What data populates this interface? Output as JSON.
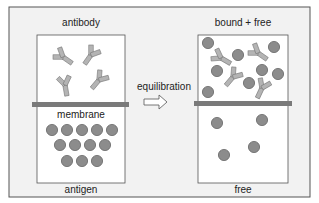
{
  "diagram": {
    "left_chamber": {
      "top_label": "antibody",
      "membrane_label": "membrane",
      "bottom_label": "antigen",
      "antibody_count": 4,
      "antigen_count": 12
    },
    "process": {
      "label": "equilibration",
      "arrow": "right-arrow-icon"
    },
    "right_chamber": {
      "top_label": "bound + free",
      "bottom_label": "free",
      "bound_complexes": 4,
      "free_antigen_top": 4,
      "free_antigen_bottom": 4
    },
    "colors": {
      "background": "#f2f2f2",
      "chamber_fill": "#ffffff",
      "membrane": "#7a7a7a",
      "antigen": "#8c8c8c",
      "antibody": "#b4b4b4",
      "outline": "#555555"
    }
  }
}
